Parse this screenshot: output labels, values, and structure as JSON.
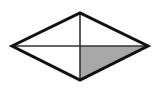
{
  "diagram": {
    "shape": "rhombus",
    "vertices": {
      "left": [
        12,
        46
      ],
      "top": [
        80,
        13
      ],
      "right": [
        148,
        46
      ],
      "bottom": [
        80,
        80
      ]
    },
    "center": [
      80,
      46
    ],
    "shaded_region": "bottom-right",
    "colors": {
      "outline": "#111111",
      "diagonal": "#333333",
      "shade": "#a8a8a8",
      "background": "#ffffff"
    }
  }
}
